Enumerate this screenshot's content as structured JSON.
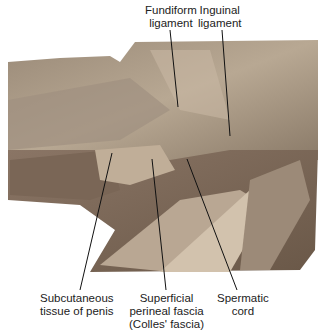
{
  "figure": {
    "type": "anatomical dissection photograph",
    "labels": [
      {
        "id": "fundiform",
        "text": "Fundiform\nligament",
        "x": 145,
        "y": 4,
        "pointer": [
          [
            170,
            30
          ],
          [
            178,
            107
          ]
        ]
      },
      {
        "id": "inguinal",
        "text": "Inguinal\nligament",
        "x": 198,
        "y": 4,
        "pointer": [
          [
            222,
            30
          ],
          [
            230,
            136
          ]
        ]
      },
      {
        "id": "subcutaneous",
        "text": "Subcutaneous\ntissue of penis",
        "x": 40,
        "y": 292,
        "pointer": [
          [
            80,
            290
          ],
          [
            112,
            153
          ]
        ]
      },
      {
        "id": "superficial",
        "text": "Superficial\nperineal fascia\n(Colles' fascia)",
        "x": 133,
        "y": 292,
        "pointer": [
          [
            166,
            290
          ],
          [
            152,
            159
          ]
        ]
      },
      {
        "id": "spermatic",
        "text": "Spermatic\ncord",
        "x": 217,
        "y": 292,
        "pointer": [
          [
            237,
            290
          ],
          [
            187,
            159
          ]
        ]
      }
    ]
  }
}
